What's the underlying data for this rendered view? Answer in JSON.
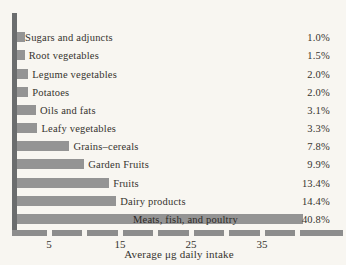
{
  "chart_data": {
    "type": "bar",
    "orientation": "horizontal",
    "title": "",
    "xlabel": "Average μg daily intake",
    "ylabel": "",
    "categories": [
      "Sugars and adjuncts",
      "Root vegetables",
      "Legume vegetables",
      "Potatoes",
      "Oils and fats",
      "Leafy vegetables",
      "Grains–cereals",
      "Garden Fruits",
      "Fruits",
      "Dairy products",
      "Meats, fish, and poultry"
    ],
    "values": [
      1.0,
      1.5,
      2.0,
      2.0,
      3.1,
      3.3,
      7.8,
      9.9,
      13.4,
      14.4,
      40.8
    ],
    "percent_labels": [
      "1.0%",
      "1.5%",
      "2.0%",
      "2.0%",
      "3.1%",
      "3.3%",
      "7.8%",
      "9.9%",
      "13.4%",
      "14.4%",
      "40.8%"
    ],
    "x_ticks": [
      5,
      15,
      25,
      35
    ],
    "x_tick_step": 5,
    "xlim": [
      0,
      46.5
    ],
    "grid": false,
    "legend": false
  },
  "colors": {
    "background": "#f8f6f1",
    "bar": "#949494",
    "y_axis": "#6b6d6e",
    "x_axis": "#8d8d8d",
    "text": "#36332e"
  }
}
